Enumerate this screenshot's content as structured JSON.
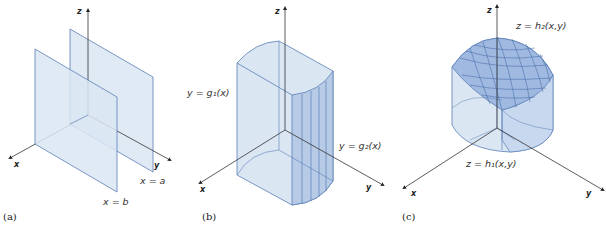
{
  "figure": {
    "panels": [
      {
        "caption": "(a)",
        "axes": {
          "x": "x",
          "y": "y",
          "z": "z"
        },
        "labels": {
          "plane_a": "x = a",
          "plane_b": "x = b"
        }
      },
      {
        "caption": "(b)",
        "axes": {
          "x": "x",
          "y": "y",
          "z": "z"
        },
        "labels": {
          "g1": "y = g₁(x)",
          "g2": "y = g₂(x)"
        }
      },
      {
        "caption": "(c)",
        "axes": {
          "x": "x",
          "y": "y",
          "z": "z"
        },
        "labels": {
          "h2": "z = h₂(x,y)",
          "h1": "z = h₁(x,y)"
        }
      }
    ],
    "colors": {
      "fill": "#dbe6f3",
      "fill_dark": "#b7cbe6",
      "stroke": "#5a7fb8",
      "axis": "#333333"
    }
  }
}
